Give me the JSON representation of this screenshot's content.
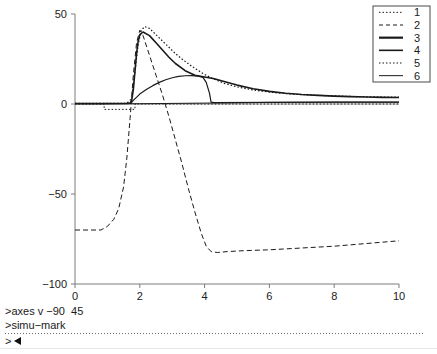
{
  "chart_data": {
    "type": "line",
    "title": "",
    "xlabel": "",
    "ylabel": "",
    "xlim": [
      0,
      10
    ],
    "ylim": [
      -100,
      50
    ],
    "xticks": [
      0,
      2,
      4,
      6,
      8,
      10
    ],
    "yticks": [
      50,
      0,
      -50,
      -100
    ],
    "xtick_labels": [
      "0",
      "2",
      "4",
      "6",
      "8",
      "10"
    ],
    "ytick_labels": [
      "50",
      "0",
      "−50",
      "−100"
    ],
    "grid": false,
    "legend_position": "top-right",
    "axis_color": "#7d7d7d",
    "line_color": "#1a1a1a",
    "zero_line_color": "#9a9a9a",
    "series": [
      {
        "name": "1",
        "label": "1",
        "style": "dotted",
        "width": 1,
        "x": [
          0.0,
          0.9,
          0.9,
          1.85,
          1.85,
          10.0
        ],
        "values": [
          0,
          0,
          -3,
          -3,
          0,
          0
        ]
      },
      {
        "name": "2",
        "label": "2",
        "style": "dashed",
        "width": 1,
        "x": [
          0.0,
          0.8,
          1.0,
          1.2,
          1.35,
          1.5,
          1.6,
          1.7,
          1.8,
          1.9,
          2.0,
          2.1,
          2.3,
          2.5,
          2.7,
          2.9,
          3.1,
          3.3,
          3.5,
          3.7,
          3.9,
          4.05,
          4.2,
          4.4,
          4.7,
          5.2,
          6.0,
          7.0,
          8.0,
          9.0,
          10.0
        ],
        "values": [
          -70,
          -70,
          -68,
          -64,
          -58,
          -46,
          -30,
          -8,
          16,
          34,
          41,
          38,
          27,
          16,
          5,
          -7,
          -20,
          -33,
          -47,
          -60,
          -72,
          -79,
          -82,
          -82.5,
          -82,
          -81.5,
          -81,
          -80,
          -79,
          -77.5,
          -76
        ]
      },
      {
        "name": "3",
        "label": "3",
        "style": "solid",
        "width": 1.6,
        "x": [
          0.0,
          1.0,
          1.6,
          1.7,
          1.75,
          1.8,
          1.85,
          1.9,
          1.95,
          2.0,
          2.1,
          2.3,
          2.5,
          2.7,
          2.9,
          3.1,
          3.4,
          3.7,
          4.0,
          4.3,
          4.6,
          5.0,
          5.5,
          6.0,
          6.5,
          7.0,
          7.5,
          8.0,
          8.5,
          9.0,
          9.5,
          10.0
        ],
        "values": [
          0.3,
          0.3,
          0.4,
          0.5,
          2.0,
          8.0,
          18.0,
          28.0,
          35.0,
          38.5,
          40.0,
          38.0,
          34.0,
          30.0,
          26.0,
          22.5,
          18.5,
          16.0,
          15.0,
          14.0,
          12.5,
          10.5,
          8.5,
          7.0,
          6.0,
          5.3,
          4.8,
          4.4,
          4.1,
          3.9,
          3.7,
          3.6
        ]
      },
      {
        "name": "4",
        "label": "4",
        "style": "solid",
        "width": 1.2,
        "x": [
          0.0,
          1.0,
          1.6,
          1.72,
          1.8,
          2.0,
          2.2,
          2.4,
          2.6,
          2.8,
          3.0,
          3.2,
          3.4,
          3.6,
          3.8,
          3.95,
          4.05,
          4.15,
          4.2,
          4.3,
          6.0,
          8.0,
          10.0
        ],
        "values": [
          0.2,
          0.2,
          0.2,
          0.3,
          2.0,
          5.5,
          8.0,
          10.2,
          12.0,
          13.5,
          14.6,
          15.3,
          15.7,
          15.8,
          15.5,
          14.8,
          12.0,
          6.0,
          1.0,
          0.8,
          0.9,
          1.0,
          1.0
        ]
      },
      {
        "name": "5",
        "label": "5",
        "style": "dotted",
        "width": 1.2,
        "x": [
          0.0,
          1.0,
          1.6,
          1.75,
          1.85,
          1.95,
          2.05,
          2.15,
          2.3,
          2.5,
          2.7,
          2.9,
          3.1,
          3.3,
          3.6,
          3.9,
          4.2,
          4.6,
          5.0,
          5.5,
          6.0,
          6.5,
          7.0,
          7.5,
          8.0,
          8.5,
          9.0,
          9.5,
          10.0
        ],
        "values": [
          0.3,
          0.3,
          0.4,
          3.0,
          18.0,
          33.0,
          41.0,
          43.0,
          42.0,
          38.5,
          35.0,
          31.5,
          28.0,
          25.0,
          21.0,
          17.5,
          14.5,
          11.5,
          9.5,
          7.8,
          6.6,
          5.8,
          5.2,
          4.8,
          4.5,
          4.2,
          4.0,
          3.9,
          3.8
        ]
      },
      {
        "name": "6",
        "label": "6",
        "style": "solid",
        "width": 1,
        "x": [
          0.0,
          2.0,
          4.0,
          6.0,
          8.0,
          10.0
        ],
        "values": [
          0.15,
          0.15,
          0.5,
          0.9,
          1.0,
          1.0
        ]
      }
    ],
    "legend_entries": [
      {
        "label": "1",
        "style": "dotted"
      },
      {
        "label": "2",
        "style": "dashed"
      },
      {
        "label": "3",
        "style": "solid-thick"
      },
      {
        "label": "4",
        "style": "solid-medium"
      },
      {
        "label": "5",
        "style": "dotted"
      },
      {
        "label": "6",
        "style": "solid-thin"
      }
    ]
  },
  "terminal": {
    "line1": ">axes v −90  45",
    "line2": ">simu−mark",
    "prompt": ">"
  }
}
